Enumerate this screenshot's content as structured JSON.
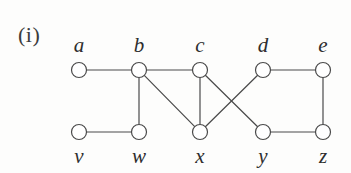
{
  "figure": {
    "label": "(i)",
    "width": 351,
    "height": 173,
    "background_color": "#fdfdfc",
    "stroke_color": "#4a4a4a",
    "node_fill_color": "#ffffff",
    "label_color": "#2e2e2e"
  },
  "graph": {
    "node_radius": 7.5,
    "stroke_width": 1.2,
    "nodes": [
      {
        "id": "a",
        "label": "a",
        "x": 79,
        "y": 70,
        "label_x": 79,
        "label_y": 45,
        "row": "top"
      },
      {
        "id": "b",
        "label": "b",
        "x": 139,
        "y": 70,
        "label_x": 139,
        "label_y": 45,
        "row": "top"
      },
      {
        "id": "c",
        "label": "c",
        "x": 200,
        "y": 70,
        "label_x": 200,
        "label_y": 45,
        "row": "top"
      },
      {
        "id": "d",
        "label": "d",
        "x": 263,
        "y": 70,
        "label_x": 263,
        "label_y": 45,
        "row": "top"
      },
      {
        "id": "e",
        "label": "e",
        "x": 323,
        "y": 70,
        "label_x": 323,
        "label_y": 45,
        "row": "top"
      },
      {
        "id": "v",
        "label": "v",
        "x": 79,
        "y": 132,
        "label_x": 79,
        "label_y": 156,
        "row": "bottom"
      },
      {
        "id": "w",
        "label": "w",
        "x": 139,
        "y": 132,
        "label_x": 139,
        "label_y": 156,
        "row": "bottom"
      },
      {
        "id": "x",
        "label": "x",
        "x": 200,
        "y": 132,
        "label_x": 200,
        "label_y": 156,
        "row": "bottom"
      },
      {
        "id": "y",
        "label": "y",
        "x": 263,
        "y": 132,
        "label_x": 263,
        "label_y": 156,
        "row": "bottom"
      },
      {
        "id": "z",
        "label": "z",
        "x": 323,
        "y": 132,
        "label_x": 323,
        "label_y": 156,
        "row": "bottom"
      }
    ],
    "edges": [
      {
        "from": "a",
        "to": "b"
      },
      {
        "from": "b",
        "to": "c"
      },
      {
        "from": "b",
        "to": "w"
      },
      {
        "from": "b",
        "to": "x"
      },
      {
        "from": "c",
        "to": "x"
      },
      {
        "from": "c",
        "to": "y"
      },
      {
        "from": "d",
        "to": "e"
      },
      {
        "from": "d",
        "to": "x"
      },
      {
        "from": "e",
        "to": "z"
      },
      {
        "from": "v",
        "to": "w"
      },
      {
        "from": "y",
        "to": "z"
      }
    ]
  }
}
